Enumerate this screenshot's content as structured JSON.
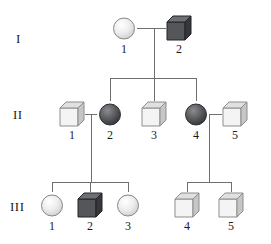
{
  "generations": [
    {
      "label": "I",
      "label_x": 16,
      "label_y": 31
    },
    {
      "label": "II",
      "label_x": 13,
      "label_y": 107
    },
    {
      "label": "III",
      "label_x": 10,
      "label_y": 199
    }
  ],
  "legend_colors": {
    "affected_fill": "#55565a",
    "affected_fill_dark": "#3c3d40",
    "unaffected_fill": "#f2f2f2",
    "unaffected_shade": "#b9b9b9",
    "outline": "#4a4a4a",
    "line": "#6f6f6f",
    "text": "#1b1b1b"
  },
  "individuals": [
    {
      "id": "I-1",
      "gen": "I",
      "num": "1",
      "sex": "female",
      "shape": "circle",
      "status": "unaffected",
      "x": 124,
      "y": 28
    },
    {
      "id": "I-2",
      "gen": "I",
      "num": "2",
      "sex": "male",
      "shape": "cube",
      "status": "affected",
      "x": 179,
      "y": 28
    },
    {
      "id": "II-1",
      "gen": "II",
      "num": "1",
      "sex": "male",
      "shape": "cube",
      "status": "unaffected",
      "x": 72,
      "y": 114
    },
    {
      "id": "II-2",
      "gen": "II",
      "num": "2",
      "sex": "female",
      "shape": "circle",
      "status": "affected",
      "x": 110,
      "y": 114
    },
    {
      "id": "II-3",
      "gen": "II",
      "num": "3",
      "sex": "male",
      "shape": "cube",
      "status": "unaffected",
      "x": 154,
      "y": 114
    },
    {
      "id": "II-4",
      "gen": "II",
      "num": "4",
      "sex": "female",
      "shape": "circle",
      "status": "affected",
      "x": 196,
      "y": 114
    },
    {
      "id": "II-5",
      "gen": "II",
      "num": "5",
      "sex": "male",
      "shape": "cube",
      "status": "unaffected",
      "x": 235,
      "y": 114
    },
    {
      "id": "III-1",
      "gen": "III",
      "num": "1",
      "sex": "female",
      "shape": "circle",
      "status": "unaffected",
      "x": 52,
      "y": 205
    },
    {
      "id": "III-2",
      "gen": "III",
      "num": "2",
      "sex": "male",
      "shape": "cube",
      "status": "affected",
      "x": 90,
      "y": 205
    },
    {
      "id": "III-3",
      "gen": "III",
      "num": "3",
      "sex": "female",
      "shape": "circle",
      "status": "unaffected",
      "x": 128,
      "y": 205
    },
    {
      "id": "III-4",
      "gen": "III",
      "num": "4",
      "sex": "male",
      "shape": "cube",
      "status": "unaffected",
      "x": 187,
      "y": 205
    },
    {
      "id": "III-5",
      "gen": "III",
      "num": "5",
      "sex": "male",
      "shape": "cube",
      "status": "unaffected",
      "x": 231,
      "y": 205
    }
  ],
  "matings": [
    {
      "id": "mating-I",
      "partners": [
        "I-1",
        "I-2"
      ],
      "line_y": 28,
      "x1": 137,
      "x2": 166,
      "drop_x": 154,
      "drop_to_y": 78
    },
    {
      "id": "mating-II-A",
      "partners": [
        "II-1",
        "II-2"
      ],
      "line_y": 114,
      "x1": 85,
      "x2": 97,
      "drop_x": 91,
      "drop_to_y": 182
    },
    {
      "id": "mating-II-B",
      "partners": [
        "II-4",
        "II-5"
      ],
      "line_y": 114,
      "x1": 209,
      "x2": 222,
      "drop_x": 209,
      "drop_to_y": 182
    }
  ],
  "sibships": [
    {
      "id": "sibship-II",
      "bar_y": 78,
      "bar_x1": 110,
      "bar_x2": 196,
      "children": [
        "II-2",
        "II-3",
        "II-4"
      ],
      "child_x": [
        110,
        154,
        196
      ],
      "stub_to_y": 101
    },
    {
      "id": "sibship-III-A",
      "bar_y": 182,
      "bar_x1": 52,
      "bar_x2": 128,
      "children": [
        "III-1",
        "III-2",
        "III-3"
      ],
      "child_x": [
        52,
        90,
        128
      ],
      "stub_to_y": 192
    },
    {
      "id": "sibship-III-B",
      "bar_y": 182,
      "bar_x1": 187,
      "bar_x2": 231,
      "children": [
        "III-4",
        "III-5"
      ],
      "child_x": [
        187,
        231
      ],
      "stub_to_y": 192
    }
  ]
}
